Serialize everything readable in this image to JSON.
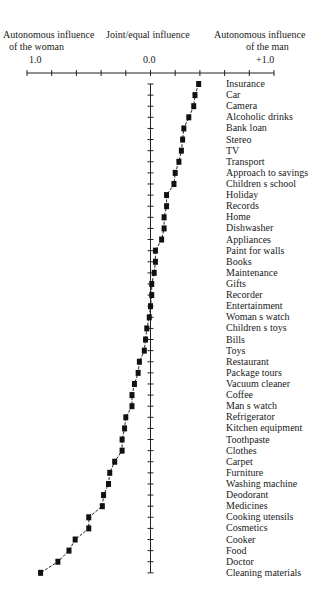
{
  "header": {
    "left_line1": "Autonomous influence",
    "left_line2": "of the woman",
    "center": "Joint/equal influence",
    "right_line1": "Autonomous influence",
    "right_line2": "of the man"
  },
  "axis": {
    "tick_labels": [
      {
        "text": "1.0",
        "value": -1.0
      },
      {
        "text": "0.0",
        "value": 0.0
      },
      {
        "text": "+1.0",
        "value": 1.0
      }
    ],
    "tick_step": 0.2,
    "range": [
      -1.0,
      1.0
    ]
  },
  "chart_data": {
    "type": "line",
    "title": "",
    "xlabel": "Autonomous influence of the woman (-1.0) — Joint/equal influence (0.0) — Autonomous influence of the man (+1.0)",
    "ylabel": "",
    "xlim": [
      -1.0,
      1.0
    ],
    "orientation": "horizontal-profile",
    "markers": "square",
    "grid": false,
    "legend": null,
    "categories": [
      "Insurance",
      "Car",
      "Camera",
      "Alcoholic drinks",
      "Bank loan",
      "Stereo",
      "TV",
      "Transport",
      "Approach to savings",
      "Children s school",
      "Holiday",
      "Records",
      "Home",
      "Dishwasher",
      "Appliances",
      "Paint for walls",
      "Books",
      "Maintenance",
      "Gifts",
      "Recorder",
      "Entertainment",
      "Woman s watch",
      "Children s toys",
      "Bills",
      "Toys",
      "Restaurant",
      "Package tours",
      "Vacuum cleaner",
      "Coffee",
      "Man s watch",
      "Refrigerator",
      "Kitchen equipment",
      "Toothpaste",
      "Clothes",
      "Carpet",
      "Furniture",
      "Washing machine",
      "Deodorant",
      "Medicines",
      "Cooking utensils",
      "Cosmetics",
      "Cooker",
      "Food",
      "Doctor",
      "Cleaning materials"
    ],
    "values": [
      0.39,
      0.36,
      0.35,
      0.31,
      0.27,
      0.26,
      0.25,
      0.23,
      0.2,
      0.19,
      0.13,
      0.13,
      0.11,
      0.11,
      0.09,
      0.04,
      0.04,
      0.03,
      0.01,
      0.01,
      0.0,
      -0.01,
      -0.03,
      -0.04,
      -0.05,
      -0.09,
      -0.1,
      -0.13,
      -0.15,
      -0.15,
      -0.2,
      -0.21,
      -0.23,
      -0.23,
      -0.29,
      -0.33,
      -0.34,
      -0.38,
      -0.39,
      -0.5,
      -0.5,
      -0.61,
      -0.66,
      -0.75,
      -0.89
    ]
  }
}
